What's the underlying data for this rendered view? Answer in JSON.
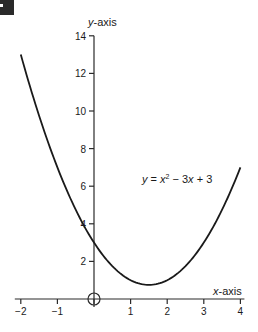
{
  "chart_data": {
    "type": "line",
    "title": "",
    "function": "y = x^2 - 3x + 3",
    "xlabel": "x-axis",
    "ylabel": "y-axis",
    "xlim": [
      -2,
      4
    ],
    "ylim": [
      0,
      14
    ],
    "grid": false,
    "legend": null,
    "x_ticks": [
      -2,
      -1,
      0,
      1,
      2,
      3,
      4
    ],
    "x_tick_labels": [
      "−2",
      "−1",
      "",
      "1",
      "2",
      "3",
      "4"
    ],
    "y_ticks": [
      2,
      4,
      6,
      8,
      10,
      12,
      14
    ],
    "y_tick_labels": [
      "2",
      "4",
      "6",
      "8",
      "10",
      "12",
      "14"
    ],
    "annotations": [
      {
        "text": "y = x² − 3x + 3",
        "x": 2.6,
        "y": 6.5
      },
      {
        "text": "origin circle",
        "x": 0,
        "y": 0
      }
    ],
    "series": [
      {
        "name": "y = x² − 3x + 3",
        "x": [
          -2,
          -1.5,
          -1,
          -0.5,
          0,
          0.5,
          1,
          1.5,
          2,
          2.5,
          3,
          3.5,
          4
        ],
        "y": [
          13,
          9.75,
          7,
          4.75,
          3,
          1.75,
          1,
          0.75,
          1,
          1.75,
          3,
          4.75,
          7
        ]
      }
    ],
    "vertex": {
      "x": 1.5,
      "y": 0.75
    }
  },
  "labels": {
    "y_axis": "y-axis",
    "x_axis": "x-axis",
    "equation_y": "y",
    "equation_eq": " = ",
    "equation_x": "x",
    "equation_sup": "2",
    "equation_rest1": " − 3",
    "equation_x2": "x",
    "equation_rest2": " + 3"
  },
  "layout": {
    "origin_px": [
      94,
      299
    ],
    "px_per_x_unit": 36.6,
    "px_per_y_unit": 18.8,
    "curve_color": "#1a1a1a",
    "axis_color": "#2a2a2a"
  }
}
